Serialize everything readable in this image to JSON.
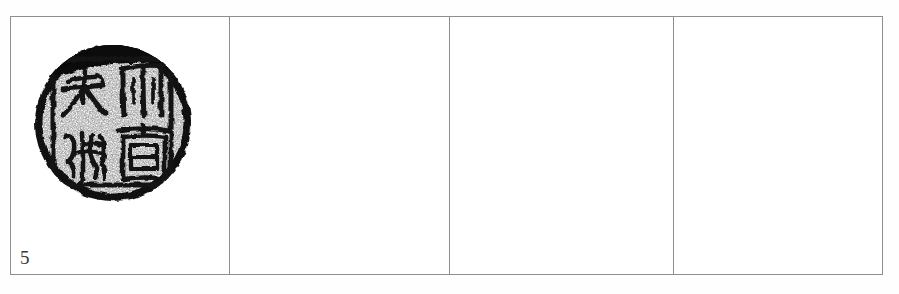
{
  "page": {
    "background_color": "#fefefe",
    "border_color": "#8e8e8e"
  },
  "table": {
    "name": "seal-plate-table",
    "rows": 1,
    "columns": 4,
    "cells": [
      {
        "index": 1,
        "caption": "5",
        "content_type": "seal-impression-rubbing",
        "empty": false
      },
      {
        "index": 2,
        "caption": "",
        "content_type": "",
        "empty": true
      },
      {
        "index": 3,
        "caption": "",
        "content_type": "",
        "empty": true
      },
      {
        "index": 4,
        "caption": "",
        "content_type": "",
        "empty": true
      }
    ]
  },
  "seal": {
    "name": "circular-seal-rubbing",
    "shape": "circle",
    "ink_color": "#111111",
    "paper_color": "#ffffff",
    "layout": "four-quadrant-grid",
    "quadrants": [
      {
        "position": "top-left",
        "character": "大"
      },
      {
        "position": "top-right",
        "character": "州"
      },
      {
        "position": "bottom-left",
        "character": "經"
      },
      {
        "position": "bottom-right",
        "character": "官"
      }
    ]
  },
  "plate": {
    "number_label": "5"
  }
}
